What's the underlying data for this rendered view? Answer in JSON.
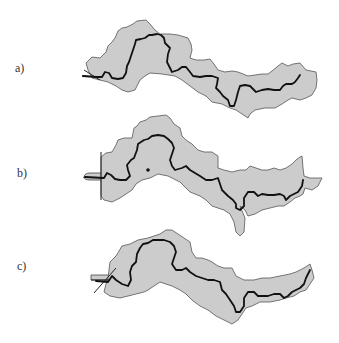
{
  "figure": {
    "panels": [
      {
        "label": "a)",
        "id": "a"
      },
      {
        "label": "b)",
        "id": "b"
      },
      {
        "label": "c)",
        "id": "c"
      }
    ],
    "colors": {
      "basin_fill": "#cccccc",
      "basin_outline": "#555555",
      "river_line": "#111111",
      "background": "#ffffff"
    }
  }
}
